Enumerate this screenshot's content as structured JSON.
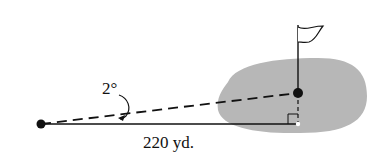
{
  "diagram": {
    "type": "golf-green-angle-problem",
    "labels": {
      "angle": "2°",
      "distance": "220 yd."
    },
    "colors": {
      "green": "#b7b7b7",
      "ink": "#111111",
      "background": "#ffffff"
    },
    "elements": {
      "tee_point": {
        "x": 41,
        "y": 124
      },
      "ball_point": {
        "x": 298,
        "y": 93
      },
      "hole_point": {
        "x": 298,
        "y": 124
      },
      "flag_pole_top_y": 25
    }
  }
}
